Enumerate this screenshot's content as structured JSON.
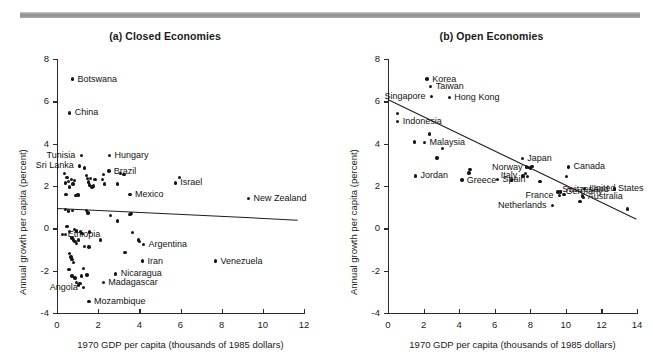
{
  "figure": {
    "top_rule_color": "#9a9a9a",
    "background": "#ffffff",
    "dot_color": "#161616"
  },
  "panels": [
    {
      "id": "a",
      "title": "(a) Closed Economies",
      "xlabel": "1970 GDP per capita (thousands of 1985 dollars)",
      "ylabel": "Annual growth per capita (percent)",
      "xticks": [
        "0",
        "2",
        "4",
        "6",
        "8",
        "10",
        "12"
      ],
      "yticks": [
        "8",
        "6",
        "4",
        "2",
        "0",
        "-2",
        "-4"
      ]
    },
    {
      "id": "b",
      "title": "(b) Open Economies",
      "xlabel": "1970 GDP per capita (thousands of 1985 dollars)",
      "ylabel": "Annual growth per capita (percent)",
      "xticks": [
        "0",
        "2",
        "4",
        "6",
        "8",
        "10",
        "12",
        "14"
      ],
      "yticks": [
        "8",
        "6",
        "4",
        "2",
        "0",
        "-2",
        "-4"
      ]
    }
  ],
  "chart_data": [
    {
      "type": "scatter",
      "title": "(a) Closed Economies",
      "xlabel": "1970 GDP per capita (thousands of 1985 dollars)",
      "ylabel": "Annual growth per capita (percent)",
      "xlim": [
        0,
        12
      ],
      "ylim": [
        -4,
        8
      ],
      "xticks": [
        0,
        2,
        4,
        6,
        8,
        10,
        12
      ],
      "yticks": [
        -4,
        -2,
        0,
        2,
        4,
        6,
        8
      ],
      "grid": false,
      "legend": "none",
      "trendline": {
        "x0": 0,
        "y0": 0.95,
        "x1": 11.7,
        "y1": 0.4
      },
      "labeled_points": [
        {
          "label": "Botswana",
          "x": 0.75,
          "y": 7.05,
          "side": "right"
        },
        {
          "label": "China",
          "x": 0.62,
          "y": 5.45,
          "side": "right"
        },
        {
          "label": "Tunisia",
          "x": 1.18,
          "y": 3.45,
          "side": "left"
        },
        {
          "label": "Sri Lanka",
          "x": 1.1,
          "y": 2.95,
          "side": "left"
        },
        {
          "label": "Hungary",
          "x": 2.55,
          "y": 3.45,
          "side": "right"
        },
        {
          "label": "Brazil",
          "x": 2.52,
          "y": 2.7,
          "side": "right"
        },
        {
          "label": "Mexico",
          "x": 3.55,
          "y": 1.6,
          "side": "right"
        },
        {
          "label": "Israel",
          "x": 5.75,
          "y": 2.15,
          "side": "right"
        },
        {
          "label": "New Zealand",
          "x": 9.3,
          "y": 1.4,
          "side": "right"
        },
        {
          "label": "Ethiopia",
          "x": 0.28,
          "y": -0.3,
          "side": "right"
        },
        {
          "label": "Argentina",
          "x": 4.2,
          "y": -0.75,
          "side": "right"
        },
        {
          "label": "Iran",
          "x": 4.15,
          "y": -1.55,
          "side": "right"
        },
        {
          "label": "Venezuela",
          "x": 7.7,
          "y": -1.55,
          "side": "right"
        },
        {
          "label": "Nicaragua",
          "x": 2.85,
          "y": -2.15,
          "side": "right"
        },
        {
          "label": "Madagascar",
          "x": 2.25,
          "y": -2.55,
          "side": "right"
        },
        {
          "label": "Angola",
          "x": 1.3,
          "y": -2.8,
          "side": "left"
        },
        {
          "label": "Mozambique",
          "x": 1.55,
          "y": -3.45,
          "side": "right"
        }
      ],
      "unlabeled_points": [
        {
          "x": 0.4,
          "y": 2.15
        },
        {
          "x": 0.48,
          "y": 2.4
        },
        {
          "x": 0.55,
          "y": 2.2
        },
        {
          "x": 0.6,
          "y": 1.95
        },
        {
          "x": 0.44,
          "y": 1.6
        },
        {
          "x": 0.7,
          "y": 2.3
        },
        {
          "x": 0.78,
          "y": 2.1
        },
        {
          "x": 0.85,
          "y": 2.25
        },
        {
          "x": 0.92,
          "y": 1.55
        },
        {
          "x": 0.99,
          "y": 1.6
        },
        {
          "x": 1.05,
          "y": 1.58
        },
        {
          "x": 1.35,
          "y": 2.85
        },
        {
          "x": 1.42,
          "y": 2.5
        },
        {
          "x": 1.48,
          "y": 2.35
        },
        {
          "x": 1.52,
          "y": 2.18
        },
        {
          "x": 1.58,
          "y": 2.05
        },
        {
          "x": 1.64,
          "y": 2.35
        },
        {
          "x": 1.7,
          "y": 1.95
        },
        {
          "x": 1.78,
          "y": 2.0
        },
        {
          "x": 1.85,
          "y": 2.32
        },
        {
          "x": 0.36,
          "y": 2.6
        },
        {
          "x": 2.2,
          "y": 2.3
        },
        {
          "x": 2.26,
          "y": 2.55
        },
        {
          "x": 2.32,
          "y": 2.1
        },
        {
          "x": 2.95,
          "y": 2.1
        },
        {
          "x": 3.1,
          "y": 2.6
        },
        {
          "x": 3.25,
          "y": 2.55
        },
        {
          "x": 5.95,
          "y": 2.4
        },
        {
          "x": 0.42,
          "y": 0.88
        },
        {
          "x": 0.55,
          "y": 0.82
        },
        {
          "x": 0.75,
          "y": 0.85
        },
        {
          "x": 1.42,
          "y": 0.85
        },
        {
          "x": 1.5,
          "y": 0.72
        },
        {
          "x": 2.6,
          "y": 0.6
        },
        {
          "x": 2.95,
          "y": 0.35
        },
        {
          "x": 3.6,
          "y": 0.7
        },
        {
          "x": 3.55,
          "y": 0.65
        },
        {
          "x": 0.48,
          "y": 0.1
        },
        {
          "x": 0.4,
          "y": -0.28
        },
        {
          "x": 0.62,
          "y": -0.15
        },
        {
          "x": 0.85,
          "y": -0.05
        },
        {
          "x": 0.95,
          "y": -0.12
        },
        {
          "x": 1.15,
          "y": -0.15
        },
        {
          "x": 1.22,
          "y": -0.25
        },
        {
          "x": 0.72,
          "y": -0.45
        },
        {
          "x": 0.8,
          "y": -0.55
        },
        {
          "x": 0.88,
          "y": -0.62
        },
        {
          "x": 0.95,
          "y": -0.72
        },
        {
          "x": 1.05,
          "y": -0.55
        },
        {
          "x": 1.58,
          "y": -0.18
        },
        {
          "x": 2.1,
          "y": -0.55
        },
        {
          "x": 3.68,
          "y": -0.2
        },
        {
          "x": 3.95,
          "y": -0.55
        },
        {
          "x": 4.02,
          "y": -0.62
        },
        {
          "x": 3.3,
          "y": -1.15
        },
        {
          "x": 1.35,
          "y": -0.85
        },
        {
          "x": 1.55,
          "y": -0.88
        },
        {
          "x": 0.62,
          "y": -1.2
        },
        {
          "x": 0.68,
          "y": -1.35
        },
        {
          "x": 0.72,
          "y": -1.48
        },
        {
          "x": 0.8,
          "y": -1.62
        },
        {
          "x": 0.58,
          "y": -1.95
        },
        {
          "x": 1.3,
          "y": -1.9
        },
        {
          "x": 0.72,
          "y": -2.25
        },
        {
          "x": 0.88,
          "y": -2.35
        },
        {
          "x": 1.18,
          "y": -2.25
        },
        {
          "x": 1.45,
          "y": -2.2
        },
        {
          "x": 0.95,
          "y": -2.55
        },
        {
          "x": 1.05,
          "y": -2.68
        },
        {
          "x": 1.12,
          "y": -2.62
        }
      ]
    },
    {
      "type": "scatter",
      "title": "(b) Open Economies",
      "xlabel": "1970 GDP per capita (thousands of 1985 dollars)",
      "ylabel": "Annual growth per capita (percent)",
      "xlim": [
        0,
        14
      ],
      "ylim": [
        -4,
        8
      ],
      "xticks": [
        0,
        2,
        4,
        6,
        8,
        10,
        12,
        14
      ],
      "yticks": [
        -4,
        -2,
        0,
        2,
        4,
        6,
        8
      ],
      "grid": false,
      "legend": "none",
      "trendline": {
        "x0": 0,
        "y0": 6.12,
        "x1": 14,
        "y1": 0.45
      },
      "labeled_points": [
        {
          "label": "Korea",
          "x": 2.2,
          "y": 7.05,
          "side": "right"
        },
        {
          "label": "Taiwan",
          "x": 2.4,
          "y": 6.7,
          "side": "right"
        },
        {
          "label": "Singapore",
          "x": 2.45,
          "y": 6.22,
          "side": "left"
        },
        {
          "label": "Hong Kong",
          "x": 3.45,
          "y": 6.18,
          "side": "right"
        },
        {
          "label": "Indonesia",
          "x": 0.55,
          "y": 5.05,
          "side": "right"
        },
        {
          "label": "Malaysia",
          "x": 2.05,
          "y": 4.05,
          "side": "right"
        },
        {
          "label": "Jordan",
          "x": 1.55,
          "y": 2.48,
          "side": "right"
        },
        {
          "label": "Greece",
          "x": 4.15,
          "y": 2.28,
          "side": "right"
        },
        {
          "label": "Japan",
          "x": 7.55,
          "y": 3.3,
          "side": "right"
        },
        {
          "label": "Norway",
          "x": 7.9,
          "y": 2.88,
          "side": "left"
        },
        {
          "label": "Italy",
          "x": 7.6,
          "y": 2.48,
          "side": "left"
        },
        {
          "label": "Spain",
          "x": 6.15,
          "y": 2.3,
          "side": "right"
        },
        {
          "label": "Canada",
          "x": 10.15,
          "y": 2.9,
          "side": "right"
        },
        {
          "label": "United States",
          "x": 11.05,
          "y": 1.88,
          "side": "right"
        },
        {
          "label": "Germany",
          "x": 9.7,
          "y": 1.72,
          "side": "right"
        },
        {
          "label": "Australia",
          "x": 10.95,
          "y": 1.52,
          "side": "right"
        },
        {
          "label": "France",
          "x": 9.65,
          "y": 1.55,
          "side": "left"
        },
        {
          "label": "Netherlands",
          "x": 9.25,
          "y": 1.08,
          "side": "left"
        },
        {
          "label": "Switzerland",
          "x": 12.75,
          "y": 1.85,
          "side": "left"
        }
      ],
      "unlabeled_points": [
        {
          "x": 0.52,
          "y": 5.42
        },
        {
          "x": 2.35,
          "y": 4.45
        },
        {
          "x": 1.5,
          "y": 4.08
        },
        {
          "x": 3.05,
          "y": 3.78
        },
        {
          "x": 2.75,
          "y": 3.32
        },
        {
          "x": 4.6,
          "y": 2.78
        },
        {
          "x": 4.55,
          "y": 2.62
        },
        {
          "x": 7.8,
          "y": 2.9
        },
        {
          "x": 8.0,
          "y": 2.85
        },
        {
          "x": 8.1,
          "y": 2.92
        },
        {
          "x": 7.72,
          "y": 2.6
        },
        {
          "x": 7.85,
          "y": 2.45
        },
        {
          "x": 8.55,
          "y": 2.22
        },
        {
          "x": 6.95,
          "y": 2.28
        },
        {
          "x": 10.05,
          "y": 2.45
        },
        {
          "x": 9.55,
          "y": 1.72
        },
        {
          "x": 9.7,
          "y": 1.75
        },
        {
          "x": 10.8,
          "y": 1.28
        },
        {
          "x": 11.0,
          "y": 1.45
        },
        {
          "x": 12.75,
          "y": 1.85
        },
        {
          "x": 13.45,
          "y": 0.92
        },
        {
          "x": 9.9,
          "y": 1.6
        }
      ]
    }
  ]
}
